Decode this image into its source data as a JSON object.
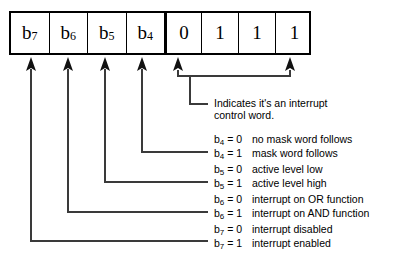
{
  "diagram": {
    "register": {
      "name": "interrupt-control-word-register",
      "cells": [
        {
          "id": "b7",
          "text": "b",
          "sub": "7",
          "kind": "bit-label"
        },
        {
          "id": "b6",
          "text": "b",
          "sub": "6",
          "kind": "bit-label"
        },
        {
          "id": "b5",
          "text": "b",
          "sub": "5",
          "kind": "bit-label"
        },
        {
          "id": "b4",
          "text": "b",
          "sub": "4",
          "kind": "bit-label"
        },
        {
          "id": "v3",
          "text": "0",
          "sub": "",
          "kind": "value"
        },
        {
          "id": "v2",
          "text": "1",
          "sub": "",
          "kind": "value"
        },
        {
          "id": "v1",
          "text": "1",
          "sub": "",
          "kind": "value"
        },
        {
          "id": "v0",
          "text": "1",
          "sub": "",
          "kind": "value"
        }
      ]
    },
    "annotations": [
      {
        "id": "identifier-note",
        "target": "low-nibble-0111",
        "lines": [
          {
            "bit": "",
            "text": "Indicates it's an interrupt"
          },
          {
            "bit": "",
            "text": "control word."
          }
        ]
      },
      {
        "id": "b4-note",
        "target": "b4",
        "lines": [
          {
            "bit": "b",
            "sub": "4",
            "eq": " = 0",
            "text": "no mask word follows"
          },
          {
            "bit": "b",
            "sub": "4",
            "eq": " = 1",
            "text": "mask word follows"
          }
        ]
      },
      {
        "id": "b5-note",
        "target": "b5",
        "lines": [
          {
            "bit": "b",
            "sub": "5",
            "eq": " = 0",
            "text": "active level low"
          },
          {
            "bit": "b",
            "sub": "5",
            "eq": " = 1",
            "text": "active level high"
          }
        ]
      },
      {
        "id": "b6-note",
        "target": "b6",
        "lines": [
          {
            "bit": "b",
            "sub": "6",
            "eq": " = 0",
            "text": "interrupt on OR function"
          },
          {
            "bit": "b",
            "sub": "6",
            "eq": " = 1",
            "text": "interrupt on AND function"
          }
        ]
      },
      {
        "id": "b7-note",
        "target": "b7",
        "lines": [
          {
            "bit": "b",
            "sub": "7",
            "eq": " = 0",
            "text": "interrupt disabled"
          },
          {
            "bit": "b",
            "sub": "7",
            "eq": " = 1",
            "text": "interrupt enabled"
          }
        ]
      }
    ],
    "colors": {
      "ink": "#000000",
      "background": "#ffffff",
      "leader": "#3a3a3a"
    }
  }
}
